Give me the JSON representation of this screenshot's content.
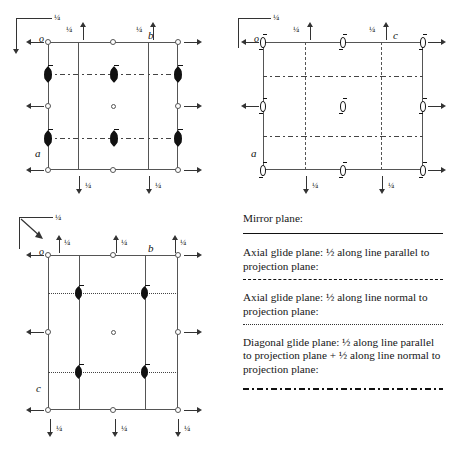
{
  "figure": {
    "fraction_label": "¼",
    "half_label": "½"
  },
  "diagrams": [
    {
      "id": "diagram-top-left",
      "axis_labels": {
        "origin": "o",
        "horizontal": "b",
        "vertical": "a"
      },
      "corner": {
        "quarter": "¼",
        "arrow_down": true,
        "arrow_diagonal": false
      },
      "top_quarters": [
        "¼",
        "¼"
      ],
      "bottom_quarters": [
        "¼",
        "¼"
      ],
      "interior_vertical_style": "solid",
      "interior_horizontal_style": "dash-dot",
      "symbol_type": "filled-lens",
      "center_symbol": "open-circle"
    },
    {
      "id": "diagram-top-right",
      "axis_labels": {
        "origin": "o",
        "horizontal": "c",
        "vertical": "a"
      },
      "corner": {
        "quarter": "¼",
        "arrow_down": false,
        "arrow_diagonal": false
      },
      "top_quarters": [
        "¼",
        "¼"
      ],
      "bottom_quarters": [
        "¼",
        "¼"
      ],
      "interior_vertical_style": "dashed",
      "interior_horizontal_style": "dash-dot",
      "symbol_type": "open-lens",
      "center_symbol": "open-lens"
    },
    {
      "id": "diagram-bottom-left",
      "axis_labels": {
        "origin": "o",
        "horizontal": "b",
        "vertical": "c"
      },
      "corner": {
        "quarter": "¼",
        "arrow_down": false,
        "arrow_diagonal": true
      },
      "top_quarters": [
        "¼",
        "¼",
        "¼"
      ],
      "bottom_quarters": [
        "¼",
        "¼",
        "¼"
      ],
      "interior_vertical_style": "solid",
      "interior_horizontal_style": "dotted",
      "symbol_type": "filled-lens",
      "center_symbol": "open-circle"
    }
  ],
  "legend": {
    "entries": [
      {
        "id": "mirror-plane",
        "text": "Mirror plane:",
        "rule": "solid"
      },
      {
        "id": "axial-glide-parallel",
        "text": "Axial glide plane: ½ along line parallel to projection plane:",
        "rule": "dashed"
      },
      {
        "id": "axial-glide-normal",
        "text": "Axial glide plane: ½ along line normal to projection plane:",
        "rule": "dotted"
      },
      {
        "id": "diagonal-glide",
        "text": "Diagonal glide plane: ½ along line parallel to projection plane + ½ along line normal to projection plane:",
        "rule": "dash-dot"
      }
    ]
  },
  "colors": {
    "ink": "#1a1a1a",
    "line": "#555555",
    "symbol": "#111111",
    "background": "#ffffff"
  }
}
